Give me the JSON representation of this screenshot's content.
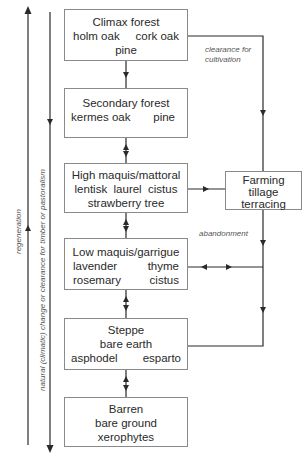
{
  "diagram": {
    "stages": [
      {
        "id": "climax",
        "title": "Climax forest",
        "rows": [
          [
            "holm oak",
            "cork oak"
          ],
          [
            "pine"
          ]
        ]
      },
      {
        "id": "secondary",
        "title": "Secondary forest",
        "rows": [
          [
            "kermes oak",
            "pine"
          ]
        ]
      },
      {
        "id": "high-maquis",
        "title": "High maquis/mattoral",
        "rows": [
          [
            "lentisk  laurel  cistus"
          ],
          [
            "strawberry tree"
          ]
        ]
      },
      {
        "id": "low-maquis",
        "title": "Low maquis/garrigue",
        "rows": [
          [
            "lavender",
            "thyme"
          ],
          [
            "rosemary",
            "cistus"
          ]
        ]
      },
      {
        "id": "steppe",
        "title": "Steppe",
        "rows": [
          [
            "bare earth"
          ],
          [
            "asphodel",
            "esparto"
          ]
        ]
      },
      {
        "id": "barren",
        "title": "Barren",
        "rows": [
          [
            "bare ground"
          ],
          [
            "xerophytes"
          ]
        ]
      }
    ],
    "farming": {
      "title": "Farming",
      "rows": [
        "tillage",
        "terracing"
      ]
    },
    "labels": {
      "clearance": "clearance for cultivation",
      "clearance_line1": "clearance for",
      "clearance_line2": "cultivation",
      "abandonment": "abandonment",
      "regeneration": "regeneration",
      "degradation": "natural (climatic) change or clearance for timber or pastoralism"
    },
    "colors": {
      "line": "#2a2a2a",
      "border": "#8a8a8a",
      "text": "#2a2a2a",
      "label": "#555555"
    }
  }
}
